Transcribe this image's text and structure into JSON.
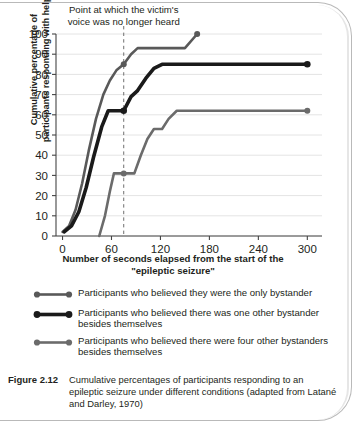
{
  "figure": {
    "number_label": "Figure 2.12",
    "caption": "Cumulative percentages of participants responding to an epileptic seizure under different conditions (adapted from Latané and Darley, 1970)"
  },
  "annotation": {
    "line1": "Point at which the victim's",
    "line2": "voice was no longer heard",
    "x_value": 75
  },
  "legend": {
    "items": [
      {
        "label": "Participants who believed they were the only bystander",
        "color": "#595959",
        "width": 2.6
      },
      {
        "label": "Participants who believed there was one other bystander besides themselves",
        "color": "#1a1a1a",
        "width": 3.6
      },
      {
        "label": "Participants who believed there were four other bystanders besides themselves",
        "color": "#6b6b6b",
        "width": 2.6
      }
    ]
  },
  "chart_data": {
    "type": "line",
    "title": "",
    "xlabel": "Number of seconds elapsed from the start of the \"epileptic seizure\"",
    "ylabel": "Cumulative percentage of participants responding with help",
    "xlim": [
      -8,
      318
    ],
    "ylim": [
      0,
      100
    ],
    "xticks": [
      0,
      60,
      120,
      180,
      240,
      300
    ],
    "yticks": [
      0,
      10,
      20,
      30,
      40,
      50,
      60,
      70,
      80,
      90,
      100
    ],
    "grid": "horizontal",
    "legend_position": "below",
    "annotations": [
      {
        "text": "Point at which the victim's voice was no longer heard",
        "type": "vline",
        "x": 75
      }
    ],
    "series": [
      {
        "name": "Participants who believed they were the only bystander",
        "color": "#595959",
        "marker_points": [
          [
            75,
            85
          ],
          [
            165,
            100
          ]
        ],
        "points": [
          [
            0,
            2
          ],
          [
            8,
            5
          ],
          [
            16,
            13
          ],
          [
            24,
            26
          ],
          [
            32,
            42
          ],
          [
            41,
            58
          ],
          [
            50,
            70
          ],
          [
            58,
            77
          ],
          [
            66,
            82
          ],
          [
            75,
            85
          ],
          [
            84,
            90
          ],
          [
            92,
            93
          ],
          [
            120,
            93
          ],
          [
            150,
            93
          ],
          [
            165,
            100
          ]
        ]
      },
      {
        "name": "Participants who believed there was one other bystander besides themselves",
        "color": "#1a1a1a",
        "marker_points": [
          [
            75,
            62
          ],
          [
            300,
            85
          ]
        ],
        "points": [
          [
            2,
            2
          ],
          [
            11,
            5
          ],
          [
            20,
            12
          ],
          [
            29,
            24
          ],
          [
            38,
            39
          ],
          [
            48,
            54
          ],
          [
            56,
            62
          ],
          [
            66,
            62
          ],
          [
            75,
            62
          ],
          [
            84,
            69
          ],
          [
            92,
            72
          ],
          [
            102,
            78
          ],
          [
            112,
            83
          ],
          [
            122,
            85
          ],
          [
            180,
            85
          ],
          [
            240,
            85
          ],
          [
            300,
            85
          ]
        ]
      },
      {
        "name": "Participants who believed there were four other bystanders besides themselves",
        "color": "#6b6b6b",
        "marker_points": [
          [
            75,
            31
          ],
          [
            300,
            62
          ]
        ],
        "points": [
          [
            45,
            0
          ],
          [
            52,
            10
          ],
          [
            58,
            22
          ],
          [
            63,
            31
          ],
          [
            75,
            31
          ],
          [
            88,
            31
          ],
          [
            96,
            40
          ],
          [
            104,
            48
          ],
          [
            112,
            53
          ],
          [
            122,
            53
          ],
          [
            130,
            58
          ],
          [
            140,
            62
          ],
          [
            180,
            62
          ],
          [
            240,
            62
          ],
          [
            300,
            62
          ]
        ]
      }
    ]
  }
}
